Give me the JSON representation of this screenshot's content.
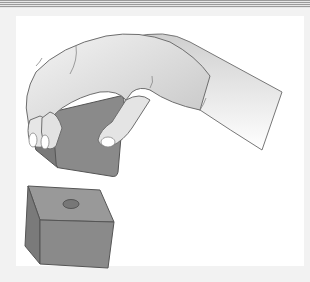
{
  "illustration": {
    "subject": "hand lifting a block above a cube with a hole",
    "elements": [
      "hand",
      "held-block",
      "cube-with-hole"
    ],
    "colors": {
      "background": "#ffffff",
      "frame": "#f2f2f2",
      "rule": "#9a9a9a",
      "skin_light": "#f0f0f0",
      "skin_shade": "#bdbdbd",
      "outline": "#6e6e6e",
      "block_face": "#8a8a8a",
      "block_side": "#7a7a7a",
      "block_top": "#999999",
      "hole": "#777777"
    }
  }
}
